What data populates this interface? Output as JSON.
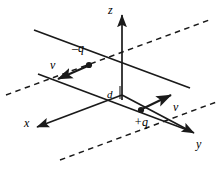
{
  "figure": {
    "type": "physics-diagram",
    "stroke_color": "#1a1a1a",
    "background_color": "#ffffff",
    "axes": [
      {
        "id": "z",
        "label": "z",
        "direction": "up",
        "label_x": 108,
        "label_y": 6
      },
      {
        "id": "x",
        "label": "x",
        "direction": "down-left-front",
        "label_x": 24,
        "label_y": 118
      },
      {
        "id": "y",
        "label": "y",
        "direction": "down-right-front",
        "label_x": 196,
        "label_y": 140
      }
    ],
    "charges": [
      {
        "id": "negative-charge",
        "label": "–q",
        "sign": "negative",
        "label_x": 74,
        "label_y": 44,
        "point_x": 86,
        "point_y": 63
      },
      {
        "id": "positive-charge",
        "label": "+q",
        "sign": "positive",
        "label_x": 142,
        "label_y": 119,
        "point_x": 142,
        "point_y": 110
      }
    ],
    "velocities": [
      {
        "id": "velocity-negative",
        "label": "v",
        "label_x": 52,
        "label_y": 57,
        "direction": "down-left"
      },
      {
        "id": "velocity-positive",
        "label": "v",
        "label_x": 168,
        "label_y": 102,
        "direction": "up-right"
      }
    ],
    "separation": {
      "id": "separation-distance",
      "label": "d",
      "label_x": 106,
      "label_y": 92
    },
    "lines": {
      "solid_trajectories": 2,
      "dashed_guides": 2
    }
  }
}
